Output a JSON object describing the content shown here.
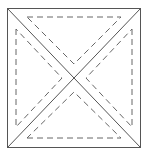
{
  "diagram": {
    "stroke_color": "#555555",
    "square": {
      "x1": 7.5,
      "y1": 8.5,
      "x2": 140.5,
      "y2": 147.5
    },
    "dashed_triangles": [
      {
        "name": "top",
        "points": "27,17 121,17 74,64"
      },
      {
        "name": "bottom",
        "points": "27,138 121,138 74,92"
      },
      {
        "name": "left",
        "points": "16,29 16,127 62,78"
      },
      {
        "name": "right",
        "points": "132,29 132,127 86,78"
      }
    ]
  }
}
